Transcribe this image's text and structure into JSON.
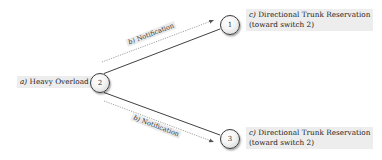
{
  "diagram": {
    "nodes": [
      {
        "id": "1",
        "label": "1"
      },
      {
        "id": "2",
        "label": "2"
      },
      {
        "id": "3",
        "label": "3"
      }
    ],
    "labels": {
      "heavy_overload": {
        "prefix": "a)",
        "text": "Heavy Overload"
      },
      "notification_top": {
        "prefix": "b)",
        "text": "Notification"
      },
      "notification_bottom": {
        "prefix": "b)",
        "text": "Notification"
      },
      "reservation_top": {
        "prefix": "c)",
        "line1": "Directional Trunk Reservation",
        "line2": "(toward switch 2)"
      },
      "reservation_bottom": {
        "prefix": "c)",
        "line1": "Directional Trunk Reservation",
        "line2": "(toward switch 2)"
      }
    },
    "edges": [
      {
        "from": "2",
        "to": "1",
        "style": "solid"
      },
      {
        "from": "2",
        "to": "1",
        "style": "dotted-arrow",
        "label": "b) Notification"
      },
      {
        "from": "2",
        "to": "3",
        "style": "solid"
      },
      {
        "from": "2",
        "to": "3",
        "style": "dotted-arrow",
        "label": "b) Notification"
      }
    ],
    "colors": {
      "line": "#2a2a2a",
      "dotted": "#777777",
      "label_bg": "#ededed"
    }
  }
}
